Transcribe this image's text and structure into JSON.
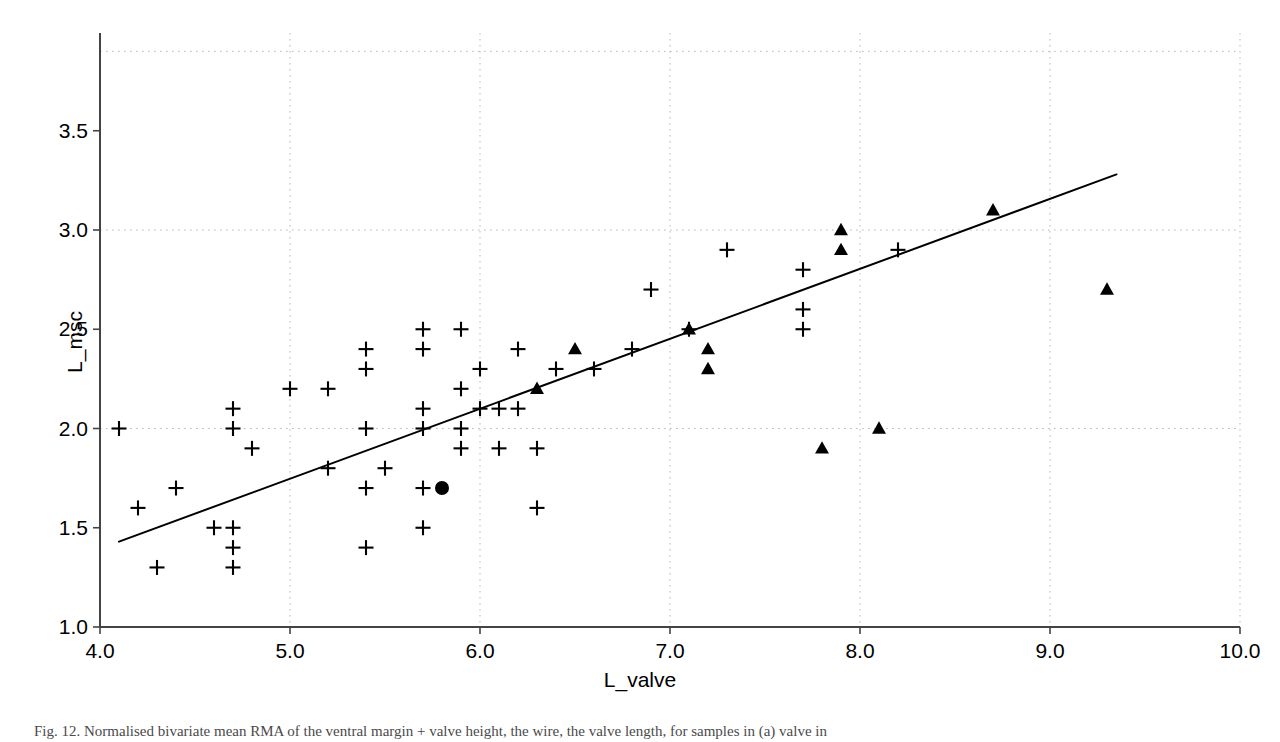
{
  "figure": {
    "caption": "Fig. 12. Normalised bivariate mean RMA of the ventral margin + valve height, the wire, the valve length, for samples in (a) valve in"
  },
  "chart_data": {
    "type": "scatter",
    "title": "",
    "xlabel": "L_valve",
    "ylabel": "L_msc",
    "xlim": [
      4.0,
      10.0
    ],
    "ylim": [
      1.0,
      3.9
    ],
    "xticks": [
      "4.0",
      "5.0",
      "6.0",
      "7.0",
      "8.0",
      "9.0",
      "10.0"
    ],
    "xtick_values": [
      4.0,
      5.0,
      6.0,
      7.0,
      8.0,
      9.0,
      10.0
    ],
    "yticks": [
      "1.0",
      "1.5",
      "2.0",
      "2.5",
      "3.0",
      "3.5"
    ],
    "ytick_values": [
      1.0,
      1.5,
      2.0,
      2.5,
      3.0,
      3.5
    ],
    "grid": true,
    "grid_style": "dotted",
    "legend": null,
    "marker_color": "#000000",
    "line_color": "#000000",
    "series": [
      {
        "name": "cross-markers",
        "marker": "plus",
        "points": [
          [
            4.1,
            2.0
          ],
          [
            4.2,
            1.6
          ],
          [
            4.3,
            1.3
          ],
          [
            4.4,
            1.7
          ],
          [
            4.6,
            1.5
          ],
          [
            4.7,
            2.1
          ],
          [
            4.7,
            2.0
          ],
          [
            4.7,
            1.5
          ],
          [
            4.7,
            1.4
          ],
          [
            4.7,
            1.3
          ],
          [
            4.8,
            1.9
          ],
          [
            5.0,
            2.2
          ],
          [
            5.2,
            2.2
          ],
          [
            5.2,
            1.8
          ],
          [
            5.4,
            2.4
          ],
          [
            5.4,
            2.3
          ],
          [
            5.4,
            2.0
          ],
          [
            5.4,
            1.7
          ],
          [
            5.4,
            1.4
          ],
          [
            5.5,
            1.8
          ],
          [
            5.7,
            2.5
          ],
          [
            5.7,
            2.4
          ],
          [
            5.7,
            2.1
          ],
          [
            5.7,
            2.0
          ],
          [
            5.7,
            1.7
          ],
          [
            5.7,
            1.5
          ],
          [
            5.9,
            2.5
          ],
          [
            5.9,
            2.2
          ],
          [
            5.9,
            2.0
          ],
          [
            5.9,
            1.9
          ],
          [
            6.0,
            2.3
          ],
          [
            6.0,
            2.1
          ],
          [
            6.1,
            2.1
          ],
          [
            6.1,
            1.9
          ],
          [
            6.2,
            2.4
          ],
          [
            6.2,
            2.1
          ],
          [
            6.3,
            1.9
          ],
          [
            6.3,
            1.6
          ],
          [
            6.4,
            2.3
          ],
          [
            6.6,
            2.3
          ],
          [
            6.8,
            2.4
          ],
          [
            6.9,
            2.7
          ],
          [
            7.1,
            2.5
          ],
          [
            7.3,
            2.9
          ],
          [
            7.7,
            2.8
          ],
          [
            7.7,
            2.6
          ],
          [
            7.7,
            2.5
          ],
          [
            8.2,
            2.9
          ]
        ]
      },
      {
        "name": "triangle-markers",
        "marker": "triangle",
        "points": [
          [
            6.3,
            2.2
          ],
          [
            6.5,
            2.4
          ],
          [
            7.1,
            2.5
          ],
          [
            7.2,
            2.4
          ],
          [
            7.2,
            2.3
          ],
          [
            7.8,
            1.9
          ],
          [
            7.9,
            3.0
          ],
          [
            7.9,
            2.9
          ],
          [
            8.1,
            2.0
          ],
          [
            8.7,
            3.1
          ],
          [
            9.3,
            2.7
          ]
        ]
      },
      {
        "name": "circle-marker",
        "marker": "circle",
        "points": [
          [
            5.8,
            1.7
          ]
        ]
      }
    ],
    "fit_line": {
      "name": "rma-regression-line",
      "x_start": 4.1,
      "y_start": 1.43,
      "x_end": 9.35,
      "y_end": 3.28
    }
  }
}
